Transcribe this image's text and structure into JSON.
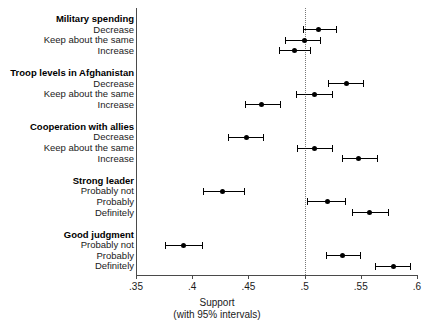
{
  "chart_data": {
    "type": "scatter",
    "title": "",
    "xlabel": "Support",
    "xlabel_sub": "(with 95% intervals)",
    "ylabel": "",
    "xlim": [
      0.35,
      0.6
    ],
    "xticks": [
      ".35",
      ".4",
      ".45",
      ".5",
      ".55",
      ".6"
    ],
    "xtick_values": [
      0.35,
      0.4,
      0.45,
      0.5,
      0.55,
      0.6
    ],
    "reference_line": 0.5,
    "grid": false,
    "legend": "none",
    "orientation": "horizontal",
    "groups": [
      {
        "name": "Military spending",
        "rows": [
          {
            "label": "Decrease",
            "estimate": 0.512,
            "ci_low": 0.499,
            "ci_high": 0.528
          },
          {
            "label": "Keep about the same",
            "estimate": 0.5,
            "ci_low": 0.483,
            "ci_high": 0.514
          },
          {
            "label": "Increase",
            "estimate": 0.491,
            "ci_low": 0.477,
            "ci_high": 0.505
          }
        ]
      },
      {
        "name": "Troop levels in Afghanistan",
        "rows": [
          {
            "label": "Decrease",
            "estimate": 0.537,
            "ci_low": 0.521,
            "ci_high": 0.552
          },
          {
            "label": "Keep about the same",
            "estimate": 0.509,
            "ci_low": 0.492,
            "ci_high": 0.524
          },
          {
            "label": "Increase",
            "estimate": 0.462,
            "ci_low": 0.447,
            "ci_high": 0.478
          }
        ]
      },
      {
        "name": "Cooperation with allies",
        "rows": [
          {
            "label": "Decrease",
            "estimate": 0.448,
            "ci_low": 0.432,
            "ci_high": 0.463
          },
          {
            "label": "Keep about the same",
            "estimate": 0.509,
            "ci_low": 0.493,
            "ci_high": 0.524
          },
          {
            "label": "Increase",
            "estimate": 0.548,
            "ci_low": 0.533,
            "ci_high": 0.564
          }
        ]
      },
      {
        "name": "Strong leader",
        "rows": [
          {
            "label": "Probably not",
            "estimate": 0.427,
            "ci_low": 0.41,
            "ci_high": 0.446
          },
          {
            "label": "Probably",
            "estimate": 0.52,
            "ci_low": 0.502,
            "ci_high": 0.536
          },
          {
            "label": "Definitely",
            "estimate": 0.558,
            "ci_low": 0.542,
            "ci_high": 0.574
          }
        ]
      },
      {
        "name": "Good judgment",
        "rows": [
          {
            "label": "Probably not",
            "estimate": 0.392,
            "ci_low": 0.376,
            "ci_high": 0.409
          },
          {
            "label": "Probably",
            "estimate": 0.534,
            "ci_low": 0.519,
            "ci_high": 0.549
          },
          {
            "label": "Definitely",
            "estimate": 0.579,
            "ci_low": 0.563,
            "ci_high": 0.594
          }
        ]
      }
    ],
    "colors": {
      "point": "#000000",
      "whisker": "#000000",
      "axis": "#4a4a4a",
      "reference_line": "#777777",
      "background": "#ffffff"
    }
  }
}
